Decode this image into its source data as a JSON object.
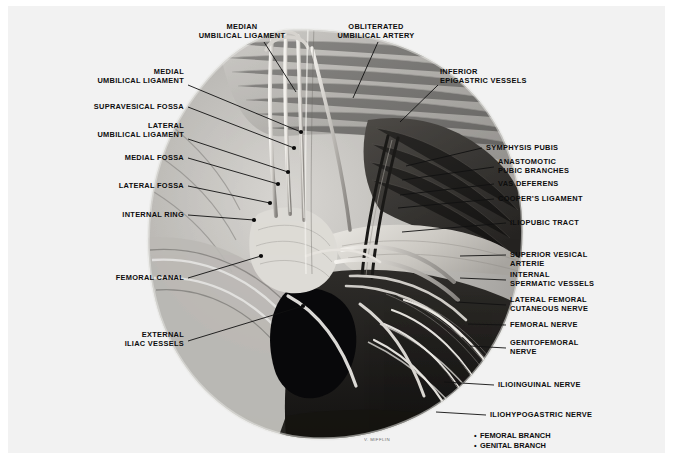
{
  "plate": {
    "title": "Anatomy of the inguinal region — posterior (laparoscopic) view",
    "background_color": "#f2f2f2",
    "signature": "V. MIFFLIN"
  },
  "labels_top": [
    {
      "id": "median-umbilical-ligament",
      "text": "MEDIAN\nUMBILICAL LIGAMENT",
      "x": 186,
      "y": 17,
      "w": 96,
      "align": "center",
      "lead": {
        "x1": 256,
        "y1": 36,
        "x2": 288,
        "y2": 86
      }
    },
    {
      "id": "obliterated-umbilical-artery",
      "text": "OBLITERATED\nUMBILICAL ARTERY",
      "x": 318,
      "y": 17,
      "w": 100,
      "align": "center",
      "lead": {
        "x1": 370,
        "y1": 36,
        "x2": 345,
        "y2": 92
      }
    }
  ],
  "labels_left": [
    {
      "id": "medial-umbilical-ligament",
      "text": "MEDIAL\nUMBILICAL LIGAMENT",
      "x": 66,
      "y": 62,
      "w": 110,
      "lead": {
        "x1": 180,
        "y1": 79,
        "x2": 293,
        "y2": 126
      }
    },
    {
      "id": "supravesical-fossa",
      "text": "SUPRAVESICAL FOSSA",
      "x": 66,
      "y": 97,
      "w": 110,
      "lead": {
        "x1": 180,
        "y1": 101,
        "x2": 286,
        "y2": 142
      }
    },
    {
      "id": "lateral-umbilical-ligament",
      "text": "LATERAL\nUMBILICAL LIGAMENT",
      "x": 66,
      "y": 116,
      "w": 110,
      "lead": {
        "x1": 180,
        "y1": 133,
        "x2": 280,
        "y2": 166
      }
    },
    {
      "id": "medial-fossa",
      "text": "MEDIAL FOSSA",
      "x": 66,
      "y": 148,
      "w": 110,
      "lead": {
        "x1": 180,
        "y1": 152,
        "x2": 270,
        "y2": 178
      }
    },
    {
      "id": "lateral-fossa",
      "text": "LATERAL FOSSA",
      "x": 66,
      "y": 176,
      "w": 110,
      "lead": {
        "x1": 180,
        "y1": 180,
        "x2": 262,
        "y2": 197
      }
    },
    {
      "id": "internal-ring",
      "text": "INTERNAL RING",
      "x": 66,
      "y": 205,
      "w": 110,
      "lead": {
        "x1": 180,
        "y1": 209,
        "x2": 246,
        "y2": 214
      }
    },
    {
      "id": "femoral-canal",
      "text": "FEMORAL CANAL",
      "x": 66,
      "y": 268,
      "w": 110,
      "lead": {
        "x1": 180,
        "y1": 272,
        "x2": 253,
        "y2": 250
      }
    },
    {
      "id": "external-iliac-vessels",
      "text": "EXTERNAL\nILIAC VESSELS",
      "x": 66,
      "y": 325,
      "w": 110,
      "lead": {
        "x1": 180,
        "y1": 335,
        "x2": 295,
        "y2": 300
      }
    }
  ],
  "labels_right": [
    {
      "id": "inferior-epigastric-vessels",
      "text": "INFERIOR\nEPIGASTRIC VESSELS",
      "x": 432,
      "y": 62,
      "lead": {
        "x1": 430,
        "y1": 79,
        "x2": 392,
        "y2": 116
      }
    },
    {
      "id": "symphysis-pubis",
      "text": "SYMPHYSIS PUBIS",
      "x": 478,
      "y": 138,
      "lead": {
        "x1": 474,
        "y1": 142,
        "x2": 398,
        "y2": 160
      }
    },
    {
      "id": "anastomotic-pubic-branches",
      "text": "ANASTOMOTIC\nPUBIC BRANCHES",
      "x": 490,
      "y": 152,
      "lead": {
        "x1": 486,
        "y1": 161,
        "x2": 394,
        "y2": 174
      }
    },
    {
      "id": "vas-deferens",
      "text": "VAS DEFERENS",
      "x": 490,
      "y": 174,
      "lead": {
        "x1": 486,
        "y1": 178,
        "x2": 392,
        "y2": 189
      }
    },
    {
      "id": "coopers-ligament",
      "text": "COOPER’S LIGAMENT",
      "x": 490,
      "y": 189,
      "lead": {
        "x1": 486,
        "y1": 193,
        "x2": 390,
        "y2": 202
      }
    },
    {
      "id": "iliopubic-tract",
      "text": "ILIOPUBIC TRACT",
      "x": 502,
      "y": 213,
      "lead": {
        "x1": 498,
        "y1": 217,
        "x2": 394,
        "y2": 226
      }
    },
    {
      "id": "superior-vesical-artery",
      "text": "SUPERIOR VESICAL\nARTERIE",
      "x": 502,
      "y": 245,
      "lead": {
        "x1": 498,
        "y1": 249,
        "x2": 452,
        "y2": 250
      }
    },
    {
      "id": "internal-spermatic-vessels",
      "text": "INTERNAL\nSPERMATIC VESSELS",
      "x": 502,
      "y": 265,
      "lead": {
        "x1": 498,
        "y1": 274,
        "x2": 452,
        "y2": 272
      }
    },
    {
      "id": "lateral-femoral-cutaneous-nerve",
      "text": "LATERAL FEMORAL\nCUTANEOUS NERVE",
      "x": 502,
      "y": 290,
      "lead": {
        "x1": 498,
        "y1": 299,
        "x2": 448,
        "y2": 296
      }
    },
    {
      "id": "femoral-nerve",
      "text": "FEMORAL NERVE",
      "x": 502,
      "y": 315,
      "lead": {
        "x1": 498,
        "y1": 319,
        "x2": 460,
        "y2": 318
      }
    },
    {
      "id": "genitofemoral-nerve",
      "text": "GENITOFEMORAL\nNERVE",
      "x": 502,
      "y": 333,
      "lead": {
        "x1": 498,
        "y1": 342,
        "x2": 462,
        "y2": 340
      }
    },
    {
      "id": "ilioinguinal-nerve",
      "text": "ILIOINGUINAL NERVE",
      "x": 490,
      "y": 375,
      "lead": {
        "x1": 486,
        "y1": 379,
        "x2": 436,
        "y2": 376
      }
    },
    {
      "id": "iliohypogastric-nerve",
      "text": "ILIOHYPOGASTRIC NERVE",
      "x": 482,
      "y": 405,
      "lead": {
        "x1": 478,
        "y1": 409,
        "x2": 428,
        "y2": 406
      }
    }
  ],
  "legend": {
    "x": 466,
    "y": 425,
    "bullet": "•",
    "items": [
      {
        "id": "femoral-branch",
        "text": "FEMORAL BRANCH"
      },
      {
        "id": "genital-branch",
        "text": "GENITAL BRANCH"
      }
    ]
  }
}
